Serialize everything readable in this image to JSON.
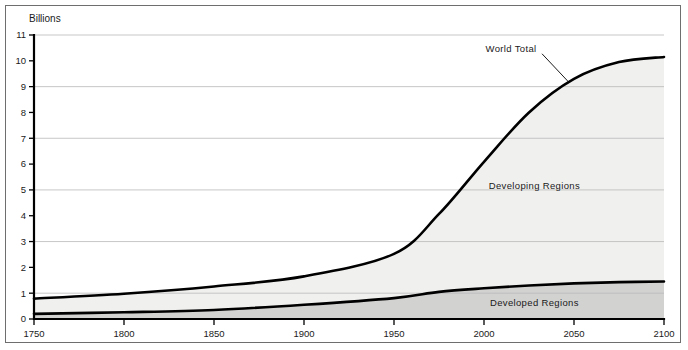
{
  "chart_data": {
    "type": "area",
    "title": "",
    "subtitle": "",
    "xlabel": "",
    "ylabel": "Billions",
    "ylim": [
      0,
      11
    ],
    "xlim": [
      1750,
      2100
    ],
    "grid": true,
    "grid_values": [
      1,
      3,
      5,
      7,
      9,
      11
    ],
    "legend_position": "inline-annotations",
    "y_ticks": [
      "0",
      "1",
      "2",
      "3",
      "4",
      "5",
      "6",
      "7",
      "8",
      "9",
      "10",
      "11"
    ],
    "y_tick_values": [
      0,
      1,
      2,
      3,
      4,
      5,
      6,
      7,
      8,
      9,
      10,
      11
    ],
    "x_ticks": [
      "1750",
      "1800",
      "1850",
      "1900",
      "1950",
      "2000",
      "2050",
      "2100"
    ],
    "x_tick_values": [
      1750,
      1800,
      1850,
      1900,
      1950,
      2000,
      2050,
      2100
    ],
    "x": [
      1750,
      1800,
      1850,
      1900,
      1950,
      1975,
      2000,
      2025,
      2050,
      2075,
      2100
    ],
    "series": [
      {
        "name": "World Total",
        "values": [
          0.79,
          0.98,
          1.26,
          1.65,
          2.52,
          4.07,
          6.09,
          8.0,
          9.3,
          9.95,
          10.15
        ],
        "fill_color": "#f0f0ef",
        "line_color": "#000000"
      },
      {
        "name": "Developed Regions",
        "values": [
          0.2,
          0.26,
          0.35,
          0.55,
          0.81,
          1.05,
          1.19,
          1.3,
          1.38,
          1.43,
          1.45
        ],
        "fill_color": "#d2d2d1",
        "line_color": "#000000"
      }
    ],
    "annotations": [
      {
        "text": "World Total",
        "x": 2015,
        "y": 10.35
      },
      {
        "text": "Developing Regions",
        "x": 2028,
        "y": 5.05
      },
      {
        "text": "Developed Regions",
        "x": 2028,
        "y": 0.5
      }
    ]
  },
  "colors": {
    "developing_fill": "#f0f0ef",
    "developed_fill": "#d2d2d1",
    "line": "#000000",
    "grid": "#b9b9b9",
    "frame": "#6e6e6e",
    "text": "#1a1a1a"
  }
}
